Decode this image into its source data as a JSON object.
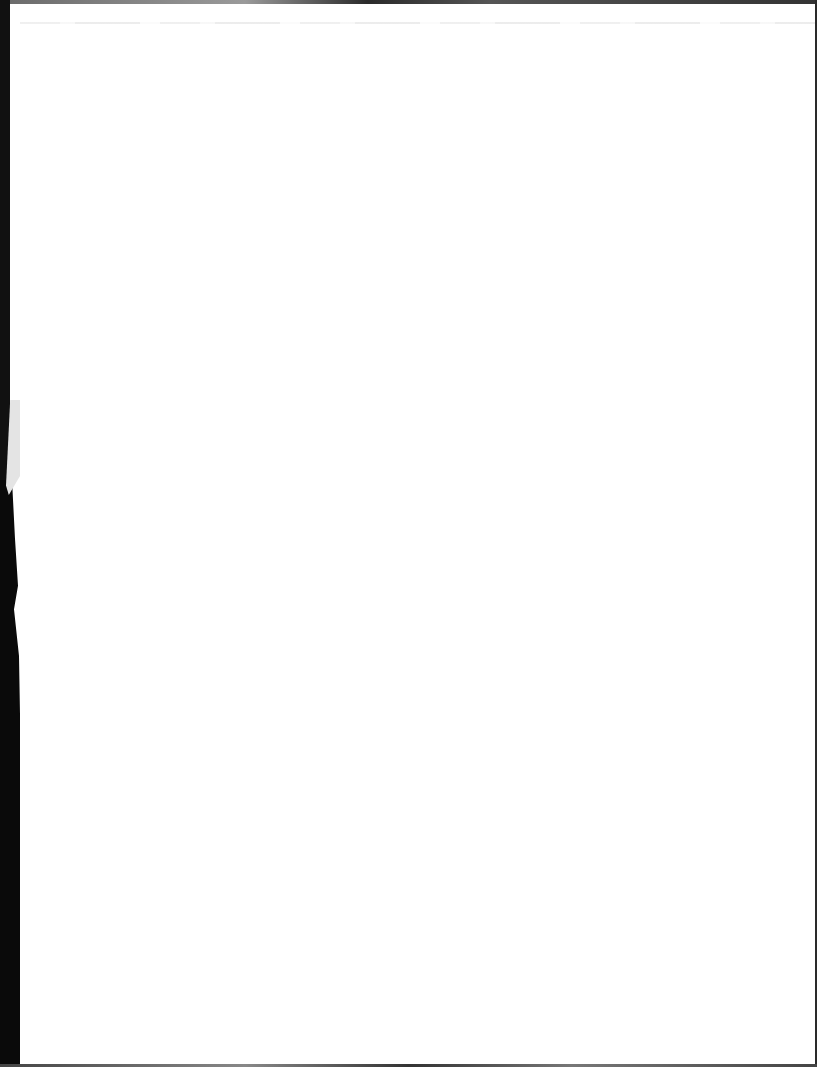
{
  "document": {
    "type": "scanned-page",
    "content": "",
    "is_blank": true,
    "colors": {
      "paper": "#ffffff",
      "scan_border": "#111111",
      "bleed_through": "#ececec"
    }
  }
}
